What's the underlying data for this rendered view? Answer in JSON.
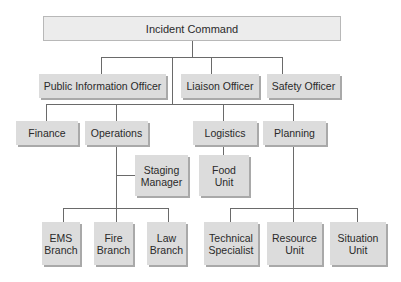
{
  "chart": {
    "title": "Incident Command",
    "command_staff": [
      {
        "label": "Public Information Officer"
      },
      {
        "label": "Liaison Officer"
      },
      {
        "label": "Safety Officer"
      }
    ],
    "sections": [
      {
        "label": "Finance"
      },
      {
        "label": "Operations"
      },
      {
        "label": "Logistics"
      },
      {
        "label": "Planning"
      }
    ],
    "operations_sub": {
      "staging": {
        "line1": "Staging",
        "line2": "Manager"
      },
      "branches": [
        {
          "line1": "EMS",
          "line2": "Branch"
        },
        {
          "line1": "Fire",
          "line2": "Branch"
        },
        {
          "line1": "Law",
          "line2": "Branch"
        }
      ]
    },
    "logistics_sub": [
      {
        "line1": "Food",
        "line2": "Unit"
      }
    ],
    "planning_sub": [
      {
        "line1": "Technical",
        "line2": "Specialist"
      },
      {
        "line1": "Resource",
        "line2": "Unit"
      },
      {
        "line1": "Situation",
        "line2": "Unit"
      }
    ]
  },
  "colors": {
    "box_fill": "#dcdcdc",
    "top_box_fill": "#ececec",
    "shadow": "#a9a9a9",
    "connector": "#6a6a6a"
  }
}
